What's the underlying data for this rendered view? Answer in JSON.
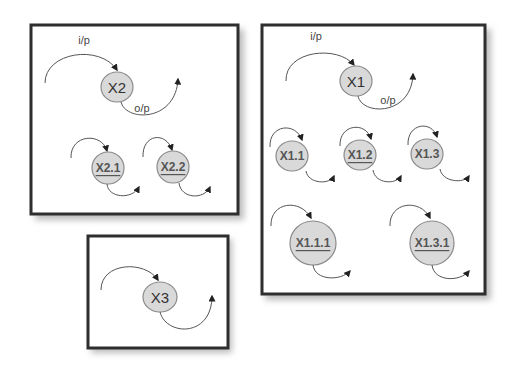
{
  "diagram": {
    "boxes": [
      {
        "id": "box-x2",
        "nodes": [
          {
            "label": "X2",
            "underlined": false,
            "role": "parent"
          },
          {
            "label": "X2.1",
            "underlined": true
          },
          {
            "label": "X2.2",
            "underlined": true
          }
        ],
        "input_label": "i/p",
        "output_label": "o/p"
      },
      {
        "id": "box-x1",
        "nodes": [
          {
            "label": "X1",
            "underlined": false,
            "role": "parent"
          },
          {
            "label": "X1.1",
            "underlined": false
          },
          {
            "label": "X1.2",
            "underlined": true
          },
          {
            "label": "X1.3",
            "underlined": false
          },
          {
            "label": "X1.1.1",
            "underlined": true
          },
          {
            "label": "X1.3.1",
            "underlined": true
          }
        ],
        "input_label": "i/p",
        "output_label": "o/p"
      },
      {
        "id": "box-x3",
        "nodes": [
          {
            "label": "X3",
            "underlined": false,
            "role": "parent"
          }
        ]
      }
    ],
    "colors": {
      "node_fill": "#d9d9d9",
      "node_stroke": "#8a8a8a",
      "box_border": "#2e2e2e",
      "arrow": "#222222"
    }
  }
}
